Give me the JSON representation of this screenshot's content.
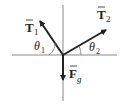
{
  "diagram": {
    "type": "free-body-diagram",
    "forces": [
      {
        "id": "T1",
        "label": "T",
        "subscript": "1",
        "vector": true,
        "direction": "up-left"
      },
      {
        "id": "T2",
        "label": "T",
        "subscript": "2",
        "vector": true,
        "direction": "up-right"
      },
      {
        "id": "Fg",
        "label": "F",
        "subscript": "g",
        "vector": true,
        "direction": "down"
      }
    ],
    "angles": [
      {
        "id": "theta1",
        "label": "θ",
        "subscript": "1"
      },
      {
        "id": "theta2",
        "label": "θ",
        "subscript": "2"
      }
    ],
    "colors": {
      "line": "#777777",
      "arrow": "#222222"
    }
  }
}
